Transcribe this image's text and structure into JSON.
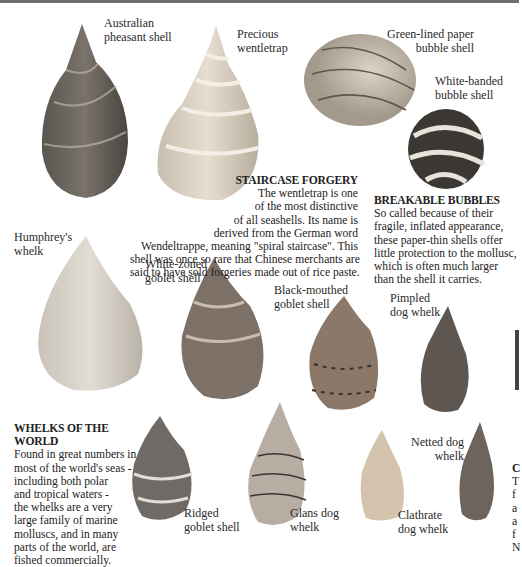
{
  "page": {
    "accent_border": "#6e6e6e",
    "labels": {
      "australian_pheasant": [
        "Australian",
        "pheasant shell"
      ],
      "precious_wentletrap": [
        "Precious",
        "wentletrap"
      ],
      "green_lined_bubble": [
        "Green-lined paper",
        "bubble shell"
      ],
      "white_banded_bubble": [
        "White-banded",
        "bubble shell"
      ],
      "humphreys_whelk": [
        "Humphrey's",
        "whelk"
      ],
      "white_zoned_goblet": [
        "White-zoned",
        "goblet shell"
      ],
      "black_mouthed_goblet": [
        "Black-mouthed",
        "goblet shell"
      ],
      "pimpled_dog_whelk": [
        "Pimpled",
        "dog whelk"
      ],
      "netted_dog_whelk": [
        "Netted dog",
        "whelk"
      ],
      "ridged_goblet": [
        "Ridged",
        "goblet shell"
      ],
      "glans_dog_whelk": [
        "Glans dog",
        "whelk"
      ],
      "clathrate_dog_whelk": [
        "Clathrate",
        "dog whelk"
      ]
    },
    "staircase": {
      "heading": "STAIRCASE FORGERY",
      "lines": [
        "The wentletrap is one",
        "of the most distinctive",
        "of all seashells. Its name is",
        "derived from the German word",
        "Wendeltrappe, meaning \"spiral staircase\". This",
        "shell was once so rare that Chinese merchants are",
        "said to have sold forgeries made out of rice paste."
      ]
    },
    "bubbles": {
      "heading": "BREAKABLE BUBBLES",
      "lines": [
        "So called because of their",
        "fragile, inflated appearance,",
        "these paper-thin shells offer",
        "little protection to the mollusc,",
        "which is often much larger",
        "than the shell it carries."
      ]
    },
    "whelks": {
      "heading": "WHELKS OF THE WORLD",
      "lines": [
        "Found in great numbers in",
        "most of the world's seas -",
        "including both polar",
        "and tropical waters -",
        "the whelks are a very",
        "large family of marine",
        "molluscs, and in many",
        "parts of the world, are",
        "fished commercially."
      ]
    },
    "cutoff_column": [
      "C",
      "T",
      "f",
      "a",
      "a",
      "f",
      "N"
    ]
  }
}
